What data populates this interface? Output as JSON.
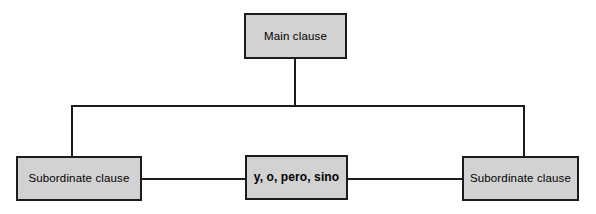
{
  "diagram": {
    "type": "tree",
    "colors": {
      "box_fill": "#d2d2d2",
      "box_border": "#1c1c1c",
      "line": "#1c1c1c",
      "background": "#ffffff",
      "text": "#000000"
    },
    "nodes": [
      {
        "id": "main-clause",
        "label": "Main clause",
        "bold": false,
        "x": 244,
        "y": 13,
        "width": 103,
        "height": 46
      },
      {
        "id": "subordinate-clause-left",
        "label": "Subordinate clause",
        "bold": false,
        "x": 16,
        "y": 156,
        "width": 126,
        "height": 45
      },
      {
        "id": "conjunctions",
        "label": "y, o, pero, sino",
        "bold": true,
        "x": 245,
        "y": 155,
        "width": 103,
        "height": 45
      },
      {
        "id": "subordinate-clause-right",
        "label": "Subordinate clause",
        "bold": false,
        "x": 462,
        "y": 156,
        "width": 117,
        "height": 45
      }
    ],
    "connectors": [
      {
        "id": "main-stem",
        "orientation": "vertical",
        "x": 294,
        "y": 59,
        "length": 47
      },
      {
        "id": "branch-bus",
        "orientation": "horizontal",
        "x": 71,
        "y": 105,
        "length": 454
      },
      {
        "id": "left-drop",
        "orientation": "vertical",
        "x": 71,
        "y": 105,
        "length": 51
      },
      {
        "id": "right-drop",
        "orientation": "vertical",
        "x": 523,
        "y": 105,
        "length": 51
      },
      {
        "id": "left-to-center",
        "orientation": "horizontal",
        "x": 142,
        "y": 178,
        "length": 103
      },
      {
        "id": "center-to-right",
        "orientation": "horizontal",
        "x": 348,
        "y": 178,
        "length": 114
      }
    ]
  }
}
